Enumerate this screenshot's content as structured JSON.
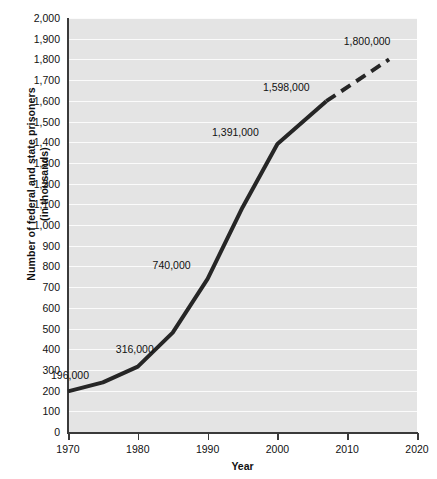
{
  "chart_data": {
    "type": "line",
    "title": "",
    "xlabel": "Year",
    "ylabel": "Number of federal and state prisoners (in thousands)",
    "ylabel_line1": "Number of federal and state prisoners",
    "ylabel_line2": "(in thousands)",
    "xlim": [
      1970,
      2020
    ],
    "ylim": [
      0,
      2000
    ],
    "x_ticks": [
      1970,
      1980,
      1990,
      2000,
      2010,
      2020
    ],
    "x_tick_labels": [
      "1970",
      "1980",
      "1990",
      "2000",
      "2010",
      "2020"
    ],
    "y_ticks": [
      0,
      100,
      200,
      300,
      400,
      500,
      600,
      700,
      800,
      900,
      1000,
      1100,
      1200,
      1300,
      1400,
      1500,
      1600,
      1700,
      1800,
      1900,
      2000
    ],
    "y_tick_labels": [
      "0",
      "100",
      "200",
      "300",
      "400",
      "500",
      "600",
      "700",
      "800",
      "900",
      "1,000",
      "1,100",
      "1,200",
      "1,300",
      "1,400",
      "1,500",
      "1,600",
      "1,700",
      "1,800",
      "1,900",
      "2,000"
    ],
    "grid": true,
    "grid_color": "#fbfbfb",
    "plot_background": "#e4e4e4",
    "line_color": "#262626",
    "legend": "none",
    "series": [
      {
        "name": "Federal and state prisoners (actual)",
        "style": "solid",
        "x": [
          1970,
          1975,
          1980,
          1985,
          1990,
          1995,
          2000,
          2007
        ],
        "values": [
          196,
          240,
          316,
          480,
          740,
          1085,
          1391,
          1598
        ]
      },
      {
        "name": "Federal and state prisoners (projected)",
        "style": "dashed",
        "x": [
          2007,
          2016
        ],
        "values": [
          1598,
          1800
        ]
      }
    ],
    "annotations": [
      {
        "label": "196,000",
        "x": 1970,
        "value": 196,
        "dx": 2,
        "dy": -16
      },
      {
        "label": "316,000",
        "x": 1980,
        "value": 316,
        "dx": -3,
        "dy": -18
      },
      {
        "label": "740,000",
        "x": 1990,
        "value": 740,
        "dx": -36,
        "dy": -14
      },
      {
        "label": "1,391,000",
        "x": 2000,
        "value": 1391,
        "dx": -42,
        "dy": -12
      },
      {
        "label": "1,598,000",
        "x": 2007,
        "value": 1598,
        "dx": -40,
        "dy": -14
      },
      {
        "label": "1,800,000",
        "x": 2016,
        "value": 1800,
        "dx": -22,
        "dy": -18
      }
    ]
  }
}
